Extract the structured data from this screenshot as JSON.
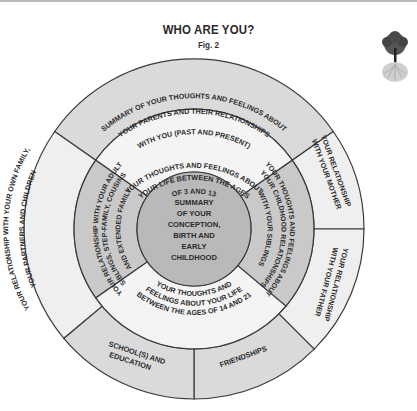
{
  "header": {
    "title": "WHO ARE YOU?",
    "subtitle": "Fig. 2"
  },
  "colors": {
    "outer_light": "#efefef",
    "outer_gray": "#dadada",
    "middle_light": "#f4f4f4",
    "middle_gray": "#c9c9c9",
    "center": "#b9b9b9",
    "stroke": "#3a3a3a"
  },
  "wheel": {
    "center": {
      "lines": [
        "SUMMARY",
        "OF YOUR",
        "CONCEPTION,",
        "BIRTH AND",
        "EARLY",
        "CHILDHOOD"
      ]
    },
    "middle_ring": {
      "top": "YOUR THOUGHTS AND FEELINGS ABOUT|YOUR LIFE BETWEEN THE AGES|OF 3 AND 13",
      "right": "YOUR THOUGHTS AND FEELINGS ABOUT|YOUR CHILDHOOD RELATIONSHIPS|WITH YOUR SIBLINGS",
      "bottom": "YOUR THOUGHTS AND|FEELINGS ABOUT YOUR LIFE|BETWEEN THE AGES OF 14 AND 21",
      "left": "YOUR RELATIONSHIP WITH YOUR ADULT|SIBLINGS, STEP-FAMILY, COUSINS|AND EXTENDED FAMILY"
    },
    "outer_ring": {
      "top": "SUMMARY OF YOUR THOUGHTS AND FEELINGS ABOUT|YOUR PARENTS AND THEIR RELATIONSHIPS|WITH YOU (PAST AND PRESENT)",
      "right_upper": "YOUR RELATIONSHIP|WITH YOUR MOTHER",
      "right_lower": "YOUR RELATIONSHIP|WITH YOUR FATHER",
      "bottom_right": "FRIENDSHIPS",
      "bottom_left": "SCHOOL(S) AND|EDUCATION",
      "left": "YOUR RELATIONSHIP WITH YOUR OWN FAMILY,|YOUR PARTNERS AND CHILDREN"
    }
  },
  "decor": {
    "tree_icon": "tree-of-life-icon"
  }
}
